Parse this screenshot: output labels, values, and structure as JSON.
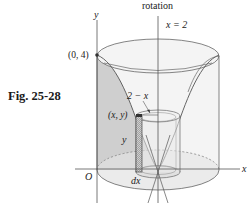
{
  "figure": {
    "caption": "Fig. 25-28",
    "axis_of_rotation_label": "rotation",
    "rotation_axis_equation": "x = 2",
    "y_axis_label": "y",
    "x_axis_label": "x",
    "origin_label": "O",
    "point_top_label": "(0, 4)",
    "point_xy_label": "(x, y)",
    "radius_label": "2 − x",
    "height_label": "y",
    "thickness_label": "dx"
  },
  "colors": {
    "line": "#555555",
    "shade": "#d6d6d6",
    "light_shade": "#ececec",
    "strip": "#bdbdbd"
  }
}
